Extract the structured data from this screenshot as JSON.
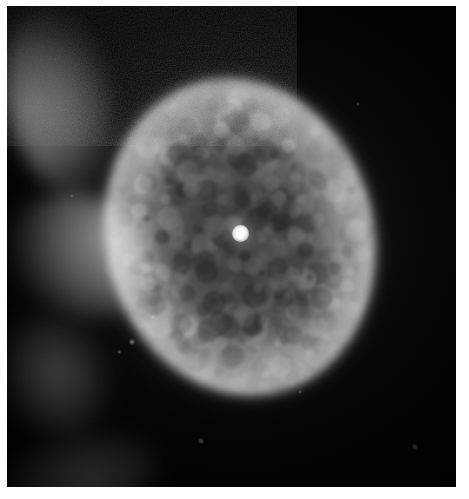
{
  "image": {
    "kind": "astronomical-photograph",
    "subject": "planetary nebula",
    "alt_text": "Grayscale astronomical photograph of an elliptical planetary nebula with a bright point-like central star",
    "caption": "",
    "width_px": 469,
    "height_px": 499
  },
  "frame": {
    "margin_top_px": 6,
    "margin_left_px": 7,
    "margin_right_px": 13,
    "margin_bottom_px": 12,
    "page_background": "#ffffff",
    "plate_background": "#050505"
  },
  "sky": {
    "background_color": "#050505",
    "grain": "film-grain",
    "grain_opacity": 0.42,
    "vignette": true
  },
  "nebula": {
    "center_x_px": 240,
    "center_y_px": 237,
    "width_px": 278,
    "height_px": 330,
    "position_angle_deg": -14,
    "shell_color": "#9e9e9e",
    "rim_color": "#e6e6e6",
    "cavity_color": "#4a4a4a",
    "structure": "limb-brightened elliptical shell with mottled texture and darker inner cavity",
    "brightest_limb": "east (right)",
    "secondary_bright_limbs": [
      "south-west (lower-left)",
      "north (top)",
      "north-west (upper-left)"
    ],
    "inner_ring": true
  },
  "central_star": {
    "x_px": 240,
    "y_px": 233,
    "diameter_px": 17,
    "color": "#ffffff",
    "glow_diameter_px": 44,
    "label": "central star"
  },
  "field_stars": [
    {
      "x_px": 132,
      "y_px": 342,
      "size_px": 2.0,
      "opacity": 0.55
    },
    {
      "x_px": 119,
      "y_px": 352,
      "size_px": 1.6,
      "opacity": 0.45
    },
    {
      "x_px": 201,
      "y_px": 441,
      "size_px": 1.8,
      "opacity": 0.4
    },
    {
      "x_px": 300,
      "y_px": 392,
      "size_px": 1.6,
      "opacity": 0.35
    },
    {
      "x_px": 415,
      "y_px": 447,
      "size_px": 1.7,
      "opacity": 0.38
    },
    {
      "x_px": 153,
      "y_px": 317,
      "size_px": 1.5,
      "opacity": 0.42
    },
    {
      "x_px": 358,
      "y_px": 104,
      "size_px": 1.4,
      "opacity": 0.3
    },
    {
      "x_px": 72,
      "y_px": 196,
      "size_px": 1.4,
      "opacity": 0.28
    }
  ]
}
